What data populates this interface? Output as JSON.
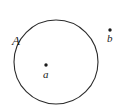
{
  "figure": {
    "type": "set-diagram",
    "background_color": "#ffffff",
    "stroke_color": "#2b2b2b",
    "text_color": "#1a1a1a",
    "width": 125,
    "height": 107,
    "set_region": {
      "name": "A",
      "label": "A",
      "shape": "circle",
      "center_x": 56,
      "center_y": 62,
      "radius": 42,
      "stroke_width": 1.1,
      "filled": false
    },
    "points": [
      {
        "name": "a",
        "label": "a",
        "x": 46,
        "y": 65,
        "inside_set": true,
        "dot_radius": 1.7
      },
      {
        "name": "b",
        "label": "b",
        "x": 110,
        "y": 30,
        "inside_set": false,
        "dot_radius": 1.7
      }
    ]
  }
}
